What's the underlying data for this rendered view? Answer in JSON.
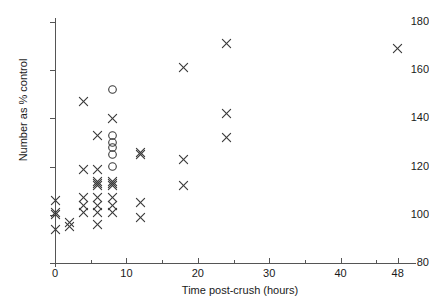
{
  "chart_data": {
    "type": "scatter",
    "title": "",
    "xlabel": "Time post-crush (hours)",
    "ylabel": "Number as % control",
    "xlim": [
      0,
      50
    ],
    "ylim": [
      80,
      180
    ],
    "grid": false,
    "legend": "none",
    "x_ticks": [
      0,
      5,
      10,
      15,
      20,
      25,
      30,
      35,
      40,
      45
    ],
    "x_tick_labels": [
      {
        "value": 0,
        "label": "0"
      },
      {
        "value": 10,
        "label": "10"
      },
      {
        "value": 20,
        "label": "20"
      },
      {
        "value": 30,
        "label": "30"
      },
      {
        "value": 40,
        "label": "40"
      },
      {
        "value": 48,
        "label": "48"
      }
    ],
    "y_ticks": [
      80,
      100,
      120,
      140,
      160,
      180
    ],
    "y_tick_labels": [
      "80",
      "100",
      "120",
      "140",
      "160",
      "180"
    ],
    "series": [
      {
        "name": "cross",
        "marker": "x",
        "color": "#3a3a3a",
        "points": [
          [
            0,
            106
          ],
          [
            0,
            101
          ],
          [
            0,
            100
          ],
          [
            0,
            94
          ],
          [
            2,
            97
          ],
          [
            2,
            95
          ],
          [
            4,
            147
          ],
          [
            4,
            119
          ],
          [
            4,
            107
          ],
          [
            4,
            104
          ],
          [
            4,
            101
          ],
          [
            6,
            133
          ],
          [
            6,
            119
          ],
          [
            6,
            114
          ],
          [
            6,
            113
          ],
          [
            6,
            112
          ],
          [
            6,
            107
          ],
          [
            6,
            104
          ],
          [
            6,
            101
          ],
          [
            6,
            96
          ],
          [
            8,
            140
          ],
          [
            8,
            114
          ],
          [
            8,
            113
          ],
          [
            8,
            112
          ],
          [
            8,
            107
          ],
          [
            8,
            104
          ],
          [
            8,
            101
          ],
          [
            12,
            126
          ],
          [
            12,
            125
          ],
          [
            12,
            105
          ],
          [
            12,
            99
          ],
          [
            18,
            161
          ],
          [
            18,
            123
          ],
          [
            18,
            112
          ],
          [
            24,
            171
          ],
          [
            24,
            142
          ],
          [
            24,
            132
          ],
          [
            48,
            169
          ]
        ]
      },
      {
        "name": "circle",
        "marker": "o",
        "color": "#3a3a3a",
        "points": [
          [
            8,
            152
          ],
          [
            8,
            133
          ],
          [
            8,
            130
          ],
          [
            8,
            128
          ],
          [
            8,
            125
          ],
          [
            8,
            120
          ]
        ]
      }
    ]
  },
  "axes": {
    "y_title": "Number as % control",
    "x_title": "Time post-crush (hours)"
  }
}
